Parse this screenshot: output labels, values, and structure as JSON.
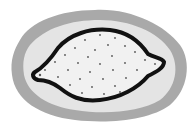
{
  "diagram": {
    "colors": {
      "background": "#ffffff",
      "outer_layer": "#a9a9a9",
      "inner_layer": "#e4e4e4",
      "outline": "#111111",
      "interior": "#f1f1f1",
      "dots": "#555555"
    }
  }
}
